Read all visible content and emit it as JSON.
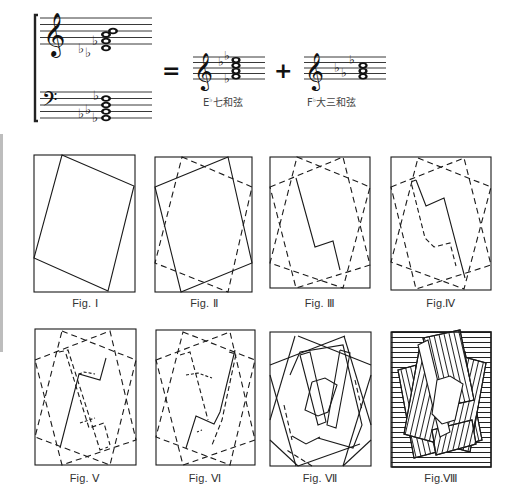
{
  "header": {
    "equals_sign": "=",
    "plus_sign": "+",
    "chords": [
      {
        "root": "E",
        "accidental": "♭",
        "name": "七和弦",
        "full": "E♭七和弦"
      },
      {
        "root": "F",
        "accidental": "♭",
        "name": "大三和弦",
        "full": "F♭大三和弦"
      }
    ],
    "icons": {
      "treble_clef": "𝄞",
      "bass_clef": "𝄢",
      "flat": "♭"
    }
  },
  "figures": [
    {
      "id": "fig-1",
      "caption": "Fig. Ⅰ"
    },
    {
      "id": "fig-2",
      "caption": "Fig. Ⅱ"
    },
    {
      "id": "fig-3",
      "caption": "Fig. Ⅲ"
    },
    {
      "id": "fig-4",
      "caption": "Fig.Ⅳ"
    },
    {
      "id": "fig-5",
      "caption": "Fig. Ⅴ"
    },
    {
      "id": "fig-6",
      "caption": "Fig. Ⅵ"
    },
    {
      "id": "fig-7",
      "caption": "Fig. Ⅶ"
    },
    {
      "id": "fig-8",
      "caption": "Fig.Ⅷ"
    }
  ],
  "colors": {
    "ink": "#1a1a1a",
    "paper": "#ffffff",
    "edge": "#bdbdbd"
  }
}
